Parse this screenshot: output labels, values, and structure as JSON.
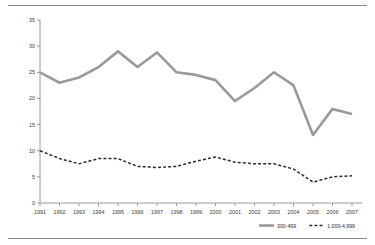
{
  "chart_data": {
    "type": "line",
    "title": "",
    "subtitle": "",
    "xlabel": "",
    "ylabel": "",
    "categories": [
      "1991",
      "1992",
      "1993",
      "1994",
      "1995",
      "1996",
      "1997",
      "1998",
      "1999",
      "2000",
      "2001",
      "2002",
      "2003",
      "2004",
      "2005",
      "2006",
      "2007"
    ],
    "ylim": [
      0,
      35
    ],
    "ytick_labels": [
      "0",
      "5",
      "10",
      "15",
      "20",
      "25",
      "30",
      "35"
    ],
    "ytick_values": [
      0,
      5,
      10,
      15,
      20,
      25,
      30,
      35
    ],
    "grid": false,
    "legend_position": "bottom-right",
    "series": [
      {
        "name": "300-499",
        "style": "solid",
        "color": "#9a9a9a",
        "values": [
          25.0,
          23.0,
          24.0,
          26.0,
          29.0,
          26.0,
          28.8,
          25.0,
          24.5,
          23.5,
          19.5,
          22.0,
          25.0,
          22.5,
          13.0,
          18.0,
          17.0
        ]
      },
      {
        "name": "1,000-4,999",
        "style": "dashed",
        "color": "#2a2a2a",
        "values": [
          10.0,
          8.5,
          7.5,
          8.5,
          8.5,
          7.0,
          6.8,
          7.0,
          8.0,
          8.8,
          7.8,
          7.5,
          7.5,
          6.5,
          4.0,
          5.0,
          5.2
        ]
      }
    ]
  },
  "legend": {
    "entries": [
      {
        "label": "300-499"
      },
      {
        "label": "1,000-4,999"
      }
    ]
  },
  "colors": {
    "series_solid": "#9a9a9a",
    "series_dashed": "#2a2a2a",
    "axis": "#9a9a9a",
    "rule": "#8a8a8a",
    "text": "#2a2a2a",
    "background": "#ffffff"
  }
}
